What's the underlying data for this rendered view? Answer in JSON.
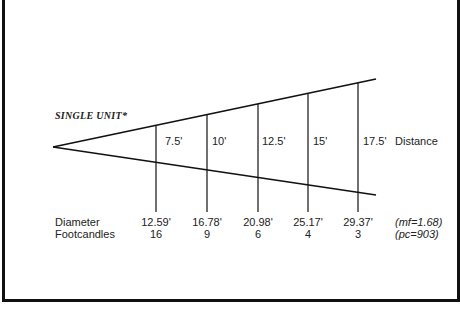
{
  "title": "SINGLE UNIT*",
  "distance_label": "Distance",
  "row_labels": {
    "diameter": "Diameter",
    "footcandles": "Footcandles"
  },
  "columns": [
    {
      "distance": "7.5'",
      "diameter": "12.59'",
      "footcandles": "16"
    },
    {
      "distance": "10'",
      "diameter": "16.78'",
      "footcandles": "9"
    },
    {
      "distance": "12.5'",
      "diameter": "20.98'",
      "footcandles": "6"
    },
    {
      "distance": "15'",
      "diameter": "25.17'",
      "footcandles": "4"
    },
    {
      "distance": "17.5'",
      "diameter": "29.37'",
      "footcandles": "3"
    }
  ],
  "notes": {
    "mf": "(mf=1.68)",
    "pc": "(pc=903)"
  },
  "colors": {
    "line": "#111111",
    "text": "#222222",
    "background": "#ffffff"
  }
}
